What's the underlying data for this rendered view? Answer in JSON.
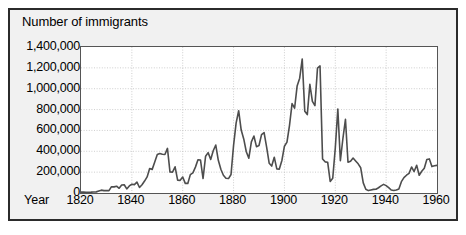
{
  "chart_data": {
    "type": "line",
    "title": "Number of immigrants",
    "xlabel": "Year",
    "ylabel": "Number of immigrants",
    "xlim": [
      1820,
      1960
    ],
    "ylim": [
      0,
      1400000
    ],
    "grid": true,
    "legend": false,
    "legend_position": "none",
    "line_color": "#4d4d4d",
    "xticks": [
      1820,
      1840,
      1860,
      1880,
      1900,
      1920,
      1940,
      1960
    ],
    "xtick_labels": [
      "1820",
      "1840",
      "1860",
      "1880",
      "1900",
      "1920",
      "1940",
      "1960"
    ],
    "yticks": [
      0,
      200000,
      400000,
      600000,
      800000,
      1000000,
      1200000,
      1400000
    ],
    "ytick_labels": [
      "0",
      "200,000",
      "400,000",
      "600,000",
      "800,000",
      "1,000,000",
      "1,200,000",
      "1,400,000"
    ],
    "x": [
      1820,
      1821,
      1822,
      1823,
      1824,
      1825,
      1826,
      1827,
      1828,
      1829,
      1830,
      1831,
      1832,
      1833,
      1834,
      1835,
      1836,
      1837,
      1838,
      1839,
      1840,
      1841,
      1842,
      1843,
      1844,
      1845,
      1846,
      1847,
      1848,
      1849,
      1850,
      1851,
      1852,
      1853,
      1854,
      1855,
      1856,
      1857,
      1858,
      1859,
      1860,
      1861,
      1862,
      1863,
      1864,
      1865,
      1866,
      1867,
      1868,
      1869,
      1870,
      1871,
      1872,
      1873,
      1874,
      1875,
      1876,
      1877,
      1878,
      1879,
      1880,
      1881,
      1882,
      1883,
      1884,
      1885,
      1886,
      1887,
      1888,
      1889,
      1890,
      1891,
      1892,
      1893,
      1894,
      1895,
      1896,
      1897,
      1898,
      1899,
      1900,
      1901,
      1902,
      1903,
      1904,
      1905,
      1906,
      1907,
      1908,
      1909,
      1910,
      1911,
      1912,
      1913,
      1914,
      1915,
      1916,
      1917,
      1918,
      1919,
      1920,
      1921,
      1922,
      1923,
      1924,
      1925,
      1926,
      1927,
      1928,
      1929,
      1930,
      1931,
      1932,
      1933,
      1934,
      1935,
      1936,
      1937,
      1938,
      1939,
      1940,
      1941,
      1942,
      1943,
      1944,
      1945,
      1946,
      1947,
      1948,
      1949,
      1950,
      1951,
      1952,
      1953,
      1954,
      1955,
      1956,
      1957,
      1958,
      1959,
      1960
    ],
    "values": [
      8385,
      9127,
      6911,
      6354,
      7912,
      10199,
      10837,
      18875,
      27382,
      22520,
      23322,
      22633,
      60482,
      58640,
      65365,
      45374,
      76242,
      79340,
      38914,
      68069,
      84066,
      80289,
      104565,
      52496,
      78615,
      114371,
      154416,
      234968,
      226527,
      297024,
      369980,
      379466,
      371603,
      368645,
      427833,
      200877,
      200436,
      251306,
      123126,
      121282,
      153640,
      91918,
      91985,
      176282,
      193418,
      248120,
      318568,
      315722,
      138840,
      352768,
      387203,
      321350,
      404806,
      459803,
      313339,
      227498,
      169986,
      141857,
      138469,
      177826,
      457257,
      669431,
      788992,
      603322,
      518592,
      395346,
      334203,
      490109,
      546889,
      444427,
      455302,
      560319,
      579663,
      439730,
      285631,
      258536,
      343267,
      230832,
      229299,
      311715,
      448572,
      487918,
      648743,
      857046,
      812870,
      1026499,
      1100735,
      1285349,
      782870,
      751786,
      1041570,
      878587,
      838172,
      1197892,
      1218480,
      326700,
      298826,
      295403,
      110618,
      141132,
      430001,
      805228,
      309556,
      522919,
      706896,
      294314,
      304488,
      335175,
      307255,
      279678,
      241700,
      97139,
      35576,
      23068,
      29470,
      34956,
      36329,
      50244,
      67895,
      82998,
      70756,
      51776,
      28781,
      23725,
      28551,
      38119,
      108721,
      147292,
      170570,
      188317,
      249187,
      205717,
      265520,
      170434,
      208177,
      237790,
      321625,
      326867,
      253265,
      260686,
      265398
    ]
  }
}
